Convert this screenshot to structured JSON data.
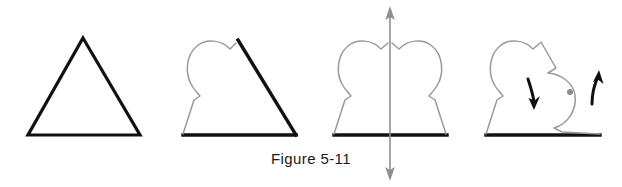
{
  "figure": {
    "caption": "Figure 5-11",
    "colors": {
      "original_outline": "#111111",
      "transformed_outline": "#9a9a9a",
      "axis_arrow": "#8f8f8f",
      "rotation_center_dot": "#8c8c8c",
      "direction_arrow": "#111111",
      "background": "#ffffff"
    },
    "panels": [
      {
        "index": 1,
        "name": "original-triangle",
        "label": "",
        "description": "Plain black outlined triangle",
        "base_y": 135,
        "apex": [
          83,
          38
        ],
        "base_left": [
          28,
          135
        ],
        "base_right": [
          140,
          135
        ],
        "has_lobe_left": false,
        "has_lobe_right": false,
        "has_axis": false,
        "has_rotation_marks": false
      },
      {
        "index": 2,
        "name": "triangle-with-left-lobe",
        "label": "",
        "description": "Triangle whose left side is replaced by a gray rounded lobe",
        "base_y": 135,
        "apex": [
          239,
          40
        ],
        "base_left": [
          183,
          135
        ],
        "base_right": [
          296,
          135
        ],
        "has_lobe_left": true,
        "has_lobe_right": false,
        "has_axis": false,
        "has_rotation_marks": false
      },
      {
        "index": 3,
        "name": "symmetric-two-lobe-shape-with-axis",
        "label": "",
        "description": "Symmetric shape with gray lobes on both sides and a vertical double headed reflection axis",
        "base_y": 135,
        "apex": [
          390,
          40
        ],
        "base_left": [
          334,
          135
        ],
        "base_right": [
          447,
          135
        ],
        "has_lobe_left": true,
        "has_lobe_right": true,
        "has_axis": true,
        "axis_x": 390,
        "axis_top_y": 8,
        "axis_bottom_y": 180,
        "has_rotation_marks": false
      },
      {
        "index": 4,
        "name": "rotated-shape-with-direction-arrows",
        "label": "",
        "description": "Shape with gray left lobe and concave right bite, gray rotation center dot and two black curved direction arrows",
        "base_y": 135,
        "apex": [
          540,
          40
        ],
        "base_left": [
          486,
          135
        ],
        "base_right": [
          600,
          135
        ],
        "has_lobe_left": true,
        "has_lobe_right": false,
        "has_concave_right": true,
        "has_axis": false,
        "has_rotation_marks": true,
        "rotation_center": [
          570,
          92
        ],
        "rotation_center_radius": 3,
        "arrow_down_left": "curved black arrow pointing down",
        "arrow_up_right": "curved black arrow pointing up"
      }
    ]
  }
}
